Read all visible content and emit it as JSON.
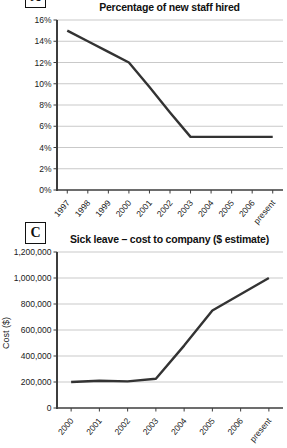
{
  "colors": {
    "line": "#333333",
    "grid": "#c9c9c9",
    "axis": "#3d3d3d",
    "text": "#1a1a1a",
    "panel_border": "#111111",
    "background": "#ffffff"
  },
  "chart_data": [
    {
      "type": "line",
      "panel_label": "A",
      "title": "Percentage of new staff hired",
      "categories": [
        "1997",
        "1998",
        "1999",
        "2000",
        "2001",
        "2002",
        "2003",
        "2004",
        "2005",
        "2006",
        "present"
      ],
      "values": [
        15,
        14,
        13,
        12,
        9.7,
        7.3,
        5,
        5,
        5,
        5,
        5
      ],
      "xlabel": "",
      "ylabel": "",
      "ylim": [
        0,
        16
      ],
      "ytick_step": 2,
      "ytick_labels": [
        "0%",
        "2%",
        "4%",
        "6%",
        "8%",
        "10%",
        "12%",
        "14%",
        "16%"
      ],
      "grid": true,
      "legend": false
    },
    {
      "type": "line",
      "panel_label": "C",
      "title": "Sick leave – cost to company ($ estimate)",
      "categories": [
        "2000",
        "2001",
        "2002",
        "2003",
        "2004",
        "2005",
        "2006",
        "present"
      ],
      "values": [
        200000,
        210000,
        205000,
        225000,
        480000,
        750000,
        875000,
        1000000
      ],
      "xlabel": "",
      "ylabel": "Cost ($)",
      "ylim": [
        0,
        1200000
      ],
      "ytick_step": 200000,
      "ytick_labels": [
        "0",
        "200,000",
        "400,000",
        "600,000",
        "800,000",
        "1,000,000",
        "1,200,000"
      ],
      "grid": true,
      "legend": false
    }
  ]
}
